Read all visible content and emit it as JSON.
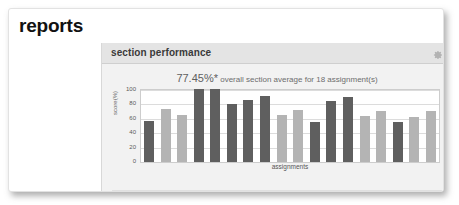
{
  "page": {
    "title": "reports"
  },
  "panel": {
    "header_title": "section performance",
    "gear_icon": "gear-icon",
    "subtitle_value": "77.45%*",
    "subtitle_rest": " overall section average for 18 assignment(s)",
    "footnote": "*As of 11/30/2009 12:52 PM CST"
  },
  "colors": {
    "bar_dark": "#5f5f5f",
    "bar_light": "#b4b4b4",
    "panel_bg": "#f2f2f2",
    "header_bg": "#e4e4e4",
    "plot_bg": "#ffffff",
    "grid": "#dcdcdc",
    "text": "#5a5a5a"
  },
  "chart_data": {
    "type": "bar",
    "title": "section performance",
    "xlabel": "assignments",
    "ylabel": "score(%)",
    "ylim": [
      0,
      100
    ],
    "yticks": [
      100,
      80,
      60,
      40,
      20,
      0
    ],
    "grid": true,
    "legend": "none",
    "categories": [
      "1",
      "2",
      "3",
      "4",
      "5",
      "6",
      "7",
      "8",
      "9",
      "10",
      "11",
      "12",
      "13",
      "14",
      "15",
      "16",
      "17",
      "18"
    ],
    "values": [
      57,
      73,
      65,
      101,
      101,
      80,
      86,
      91,
      65,
      72,
      56,
      85,
      90,
      64,
      71,
      55,
      63,
      71
    ],
    "bar_shades": [
      "dark",
      "light",
      "light",
      "dark",
      "dark",
      "dark",
      "dark",
      "dark",
      "light",
      "light",
      "dark",
      "dark",
      "dark",
      "light",
      "light",
      "dark",
      "light",
      "light"
    ],
    "annotation": "77.45%* overall section average for 18 assignment(s)",
    "footnote": "*As of 11/30/2009 12:52 PM CST"
  }
}
